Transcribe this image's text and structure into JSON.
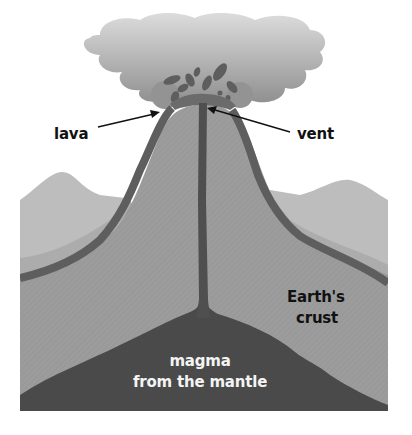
{
  "diagram": {
    "labels": {
      "lava": "lava",
      "vent": "vent",
      "crust_line1": "Earth's",
      "crust_line2": "crust",
      "magma_line1": "magma",
      "magma_line2": "from the mantle"
    },
    "colors": {
      "background": "#ffffff",
      "cloud_top": "#d2d2d2",
      "cloud_bottom": "#8a8a8a",
      "lava_dark": "#5e5e5e",
      "cone_fill": "#9a9a9a",
      "hills_far": "#bdbdbd",
      "hills_mid": "#acacac",
      "magma": "#4a4a4a",
      "label_dark": "#111111",
      "label_light": "#f4f4f4"
    }
  }
}
